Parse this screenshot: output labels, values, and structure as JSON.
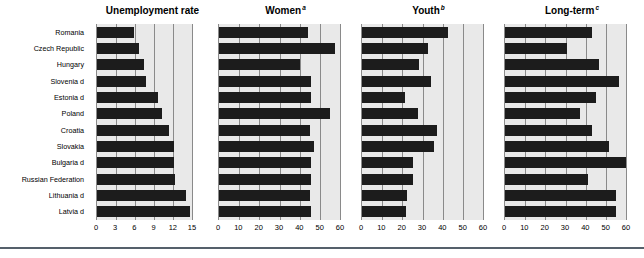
{
  "figure": {
    "categories": [
      "Romania",
      "Czech Republic",
      "Hungary",
      "Slovenia d",
      "Estonia d",
      "Poland",
      "Croatia",
      "Slovakia",
      "Bulgaria d",
      "Russian Federation",
      "Lithuania d",
      "Latvia d"
    ]
  },
  "panels": [
    {
      "title": "Unemployment rate",
      "superscript": "",
      "ticks": [
        "0",
        "3",
        "6",
        "9",
        "12",
        "15"
      ],
      "xmax": 15
    },
    {
      "title": "Women",
      "superscript": "a",
      "ticks": [
        "0",
        "10",
        "20",
        "30",
        "40",
        "50",
        "60"
      ],
      "xmax": 60
    },
    {
      "title": "Youth",
      "superscript": "b",
      "ticks": [
        "0",
        "10",
        "20",
        "30",
        "40",
        "50",
        "60"
      ],
      "xmax": 60
    },
    {
      "title": "Long-term",
      "superscript": "c",
      "ticks": [
        "0",
        "10",
        "20",
        "30",
        "40",
        "50",
        "60"
      ],
      "xmax": 60
    }
  ],
  "chart_data": [
    {
      "type": "bar",
      "title": "Unemployment rate",
      "orientation": "horizontal",
      "xlabel": "",
      "ylabel": "",
      "xlim": [
        0,
        15
      ],
      "xticks": [
        0,
        3,
        6,
        9,
        12,
        15
      ],
      "grid": true,
      "legend": "none",
      "categories": [
        "Romania",
        "Czech Republic",
        "Hungary",
        "Slovenia d",
        "Estonia d",
        "Poland",
        "Croatia",
        "Slovakia",
        "Bulgaria d",
        "Russian Federation",
        "Lithuania d",
        "Latvia d"
      ],
      "values": [
        5.8,
        6.7,
        7.4,
        7.7,
        9.6,
        10.3,
        11.4,
        12.2,
        12.2,
        12.3,
        14.0,
        14.7
      ]
    },
    {
      "type": "bar",
      "title": "Women",
      "orientation": "horizontal",
      "xlabel": "",
      "ylabel": "",
      "xlim": [
        0,
        60
      ],
      "xticks": [
        0,
        10,
        20,
        30,
        40,
        50,
        60
      ],
      "grid": true,
      "legend": "none",
      "categories": [
        "Romania",
        "Czech Republic",
        "Hungary",
        "Slovenia d",
        "Estonia d",
        "Poland",
        "Croatia",
        "Slovakia",
        "Bulgaria d",
        "Russian Federation",
        "Lithuania d",
        "Latvia d"
      ],
      "values": [
        44.0,
        57.5,
        40.0,
        45.5,
        45.5,
        55.0,
        45.0,
        47.0,
        45.5,
        45.5,
        45.0,
        45.5
      ]
    },
    {
      "type": "bar",
      "title": "Youth",
      "orientation": "horizontal",
      "xlabel": "",
      "ylabel": "",
      "xlim": [
        0,
        60
      ],
      "xticks": [
        0,
        10,
        20,
        30,
        40,
        50,
        60
      ],
      "grid": true,
      "legend": "none",
      "categories": [
        "Romania",
        "Czech Republic",
        "Hungary",
        "Slovenia d",
        "Estonia d",
        "Poland",
        "Croatia",
        "Slovakia",
        "Bulgaria d",
        "Russian Federation",
        "Lithuania d",
        "Latvia d"
      ],
      "values": [
        42.5,
        32.5,
        28.5,
        34.0,
        21.5,
        28.0,
        37.0,
        35.5,
        25.5,
        25.5,
        22.5,
        22.0
      ]
    },
    {
      "type": "bar",
      "title": "Long-term",
      "orientation": "horizontal",
      "xlabel": "",
      "ylabel": "",
      "xlim": [
        0,
        60
      ],
      "xticks": [
        0,
        10,
        20,
        30,
        40,
        50,
        60
      ],
      "grid": true,
      "legend": "none",
      "categories": [
        "Romania",
        "Czech Republic",
        "Hungary",
        "Slovenia d",
        "Estonia d",
        "Poland",
        "Croatia",
        "Slovakia",
        "Bulgaria d",
        "Russian Federation",
        "Lithuania d",
        "Latvia d"
      ],
      "values": [
        43.0,
        30.5,
        46.5,
        56.5,
        45.0,
        37.0,
        43.0,
        51.5,
        60.0,
        41.0,
        55.0,
        55.0
      ]
    }
  ],
  "colors": {
    "bar": "#1c1c1c",
    "plot_background": "#e9e9e9",
    "gridline": "#8a8a8a",
    "rule": "#55606b",
    "text": "#000000"
  }
}
